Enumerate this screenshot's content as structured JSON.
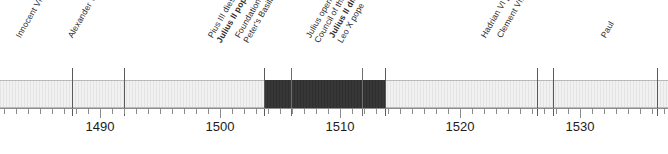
{
  "timeline": {
    "axis": {
      "start_year": 1481.667,
      "end_year": 1537.333,
      "px_per_year": 12,
      "minor_tick_years": 1,
      "major_tick_years": 10,
      "decade_labels": [
        {
          "label": "1490",
          "year": 1490,
          "x": 100
        },
        {
          "label": "1500",
          "year": 1500,
          "x": 220
        },
        {
          "label": "1510",
          "year": 1510,
          "x": 340
        },
        {
          "label": "1520",
          "year": 1520,
          "x": 460
        },
        {
          "label": "1530",
          "year": 1530,
          "x": 580
        }
      ]
    },
    "spans": [
      {
        "name": "julius-ii-papacy",
        "x": 264,
        "width": 121,
        "style": "dark",
        "color": "#333333"
      }
    ],
    "band": {
      "color": "#ededed",
      "border_color": "#b9b9b9"
    },
    "events": [
      {
        "id": "innocent-viii-pope",
        "x": 72,
        "line1": "Innocent VIII pope",
        "line1_bold": false,
        "line2": "",
        "line2_bold": false,
        "on_dark": false
      },
      {
        "id": "alexander-vi-pope",
        "x": 124,
        "line1": "Alexander VI pope",
        "line1_bold": false,
        "line2": "",
        "line2_bold": false,
        "on_dark": false
      },
      {
        "id": "pius-iii-dies-julius-ii-pope",
        "x": 264,
        "line1": "Pius III dies;",
        "line1_bold": false,
        "line2": "Julius II pope",
        "line2_bold": true,
        "on_dark": false
      },
      {
        "id": "foundation-stone-st-peters",
        "x": 291,
        "line1": "Foundation stone of new St.",
        "line1_bold": false,
        "line2": "Peter's Basilica laid by Julius",
        "line2_bold": false,
        "on_dark": true
      },
      {
        "id": "julius-opens-18th-general-council",
        "x": 362,
        "line1": "Julius opens 18th General",
        "line1_bold": false,
        "line2": "Council of the Church",
        "line2_bold": false,
        "on_dark": true
      },
      {
        "id": "julius-ii-dies-leo-x-pope",
        "x": 385,
        "line1": "Julius II dies;",
        "line1_bold": true,
        "line2": "Leo X pope",
        "line2_bold": false,
        "on_dark": false
      },
      {
        "id": "hadrian-vi-pope",
        "x": 537,
        "line1": "Hadrian VI pope",
        "line1_bold": false,
        "line2": "",
        "line2_bold": false,
        "on_dark": false
      },
      {
        "id": "clement-vii-pope",
        "x": 553,
        "line1": "Clement VII pope",
        "line1_bold": false,
        "line2": "",
        "line2_bold": false,
        "on_dark": false
      },
      {
        "id": "paul-pope",
        "x": 657,
        "line1": "Paul",
        "line1_bold": false,
        "line2": "",
        "line2_bold": false,
        "on_dark": false
      }
    ]
  }
}
